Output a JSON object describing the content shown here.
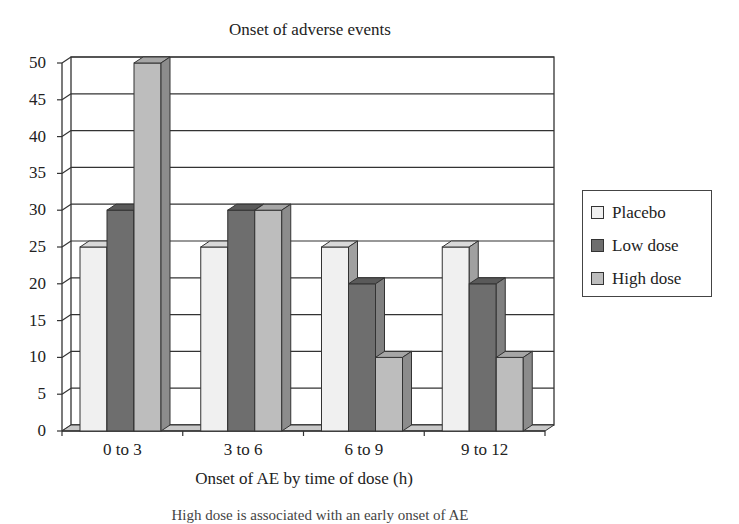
{
  "chart_data": {
    "type": "bar",
    "style": "3d-clustered-column",
    "title": "Onset of adverse events",
    "xlabel": "Onset of AE by time of dose (h)",
    "ylabel": "",
    "ylim": [
      0,
      50
    ],
    "yticks": [
      0,
      5,
      10,
      15,
      20,
      25,
      30,
      35,
      40,
      45,
      50
    ],
    "grid": true,
    "legend_position": "right",
    "categories": [
      "0 to 3",
      "3 to 6",
      "6 to 9",
      "9 to 12"
    ],
    "series": [
      {
        "name": "Placebo",
        "values": [
          25,
          25,
          25,
          25
        ],
        "color": "#f0f0f0"
      },
      {
        "name": "Low dose",
        "values": [
          30,
          30,
          20,
          20
        ],
        "color": "#6e6e6e"
      },
      {
        "name": "High dose",
        "values": [
          50,
          30,
          10,
          10
        ],
        "color": "#bdbdbd"
      }
    ]
  },
  "labels": {
    "title": "Onset of adverse events",
    "xlabel": "Onset of AE by time of dose (h)",
    "caption": "High dose is associated with an early onset of AE",
    "yticks": [
      "0",
      "5",
      "10",
      "15",
      "20",
      "25",
      "30",
      "35",
      "40",
      "45",
      "50"
    ],
    "categories": [
      "0 to 3",
      "3 to 6",
      "6 to 9",
      "9 to 12"
    ],
    "legend": [
      "Placebo",
      "Low dose",
      "High dose"
    ]
  }
}
